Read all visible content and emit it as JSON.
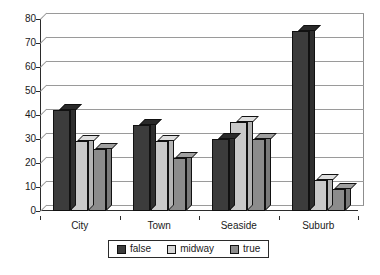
{
  "chart_data": {
    "type": "bar",
    "title": "",
    "subtitle": "",
    "xlabel": "",
    "ylabel": "",
    "categories": [
      "City",
      "Town",
      "Seaside",
      "Suburb"
    ],
    "series": [
      {
        "name": "false",
        "color": "#3c3c3c",
        "values": [
          42,
          36,
          30,
          75
        ]
      },
      {
        "name": "midway",
        "color": "#c9c9c9",
        "values": [
          29,
          29,
          37,
          13
        ]
      },
      {
        "name": "true",
        "color": "#8c8c8c",
        "values": [
          26,
          22,
          30,
          9
        ]
      }
    ],
    "ylim": [
      0,
      80
    ],
    "ytick_step": 10,
    "yticks": [
      "80",
      "70",
      "60",
      "50",
      "40",
      "30",
      "20",
      "10",
      "0"
    ],
    "grid": true,
    "grid_axis": "y",
    "legend_position": "bottom",
    "three_d": true,
    "background": "#ffffff"
  },
  "legend": {
    "items": [
      {
        "label": "false"
      },
      {
        "label": "midway"
      },
      {
        "label": "true"
      }
    ]
  }
}
